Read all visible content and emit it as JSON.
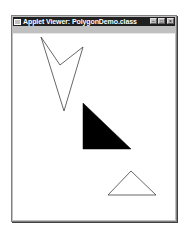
{
  "window": {
    "title": "Applet Viewer: PolygonDemo.class",
    "controls": {
      "minimize": "minimize-icon",
      "maximize": "maximize-icon",
      "close": "close-icon"
    }
  },
  "menubar": {
    "items": [
      {
        "label": "Applet"
      }
    ]
  },
  "canvas": {
    "shapes": [
      {
        "name": "arrowhead-polygon",
        "type": "outline",
        "points": "41,37 60,65 83,47 64,111",
        "stroke": "#404040"
      },
      {
        "name": "filled-triangle",
        "type": "filled",
        "points": "83,103 131,149 83,149",
        "fill": "#000000"
      },
      {
        "name": "outline-triangle",
        "type": "outline",
        "points": "131,171 156,195 108,195",
        "stroke": "#404040"
      }
    ]
  }
}
